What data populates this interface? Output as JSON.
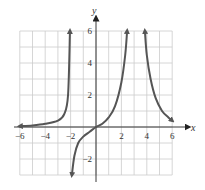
{
  "chart_data": {
    "type": "line",
    "title": "",
    "xlabel": "x",
    "ylabel": "y",
    "xlim": [
      -6,
      6
    ],
    "ylim": [
      -3,
      6
    ],
    "grid": true,
    "grid_step": 1,
    "x_ticks": [
      -6,
      -4,
      -2,
      2,
      4,
      6
    ],
    "y_ticks": [
      -2,
      2,
      4,
      6
    ],
    "x_tick_labels": [
      "−6",
      "−4",
      "−2",
      "2",
      "4",
      "6"
    ],
    "y_tick_labels": [
      "−2",
      "2",
      "4",
      "6"
    ],
    "vertical_asymptotes": [
      -2,
      2.5,
      3.8
    ],
    "series": [
      {
        "name": "left branch",
        "x": [
          -6,
          -5,
          -4,
          -3,
          -2.5,
          -2.2,
          -2.05
        ],
        "y": [
          0.05,
          0.1,
          0.2,
          0.4,
          0.8,
          2.0,
          6.0
        ],
        "arrows": [
          "left",
          "up"
        ]
      },
      {
        "name": "middle branch",
        "x": [
          -1.9,
          -1.7,
          -1.4,
          -1,
          -0.5,
          0,
          0.5,
          1,
          1.5,
          2,
          2.3,
          2.45
        ],
        "y": [
          -3.0,
          -1.8,
          -1.0,
          -0.6,
          -0.3,
          0,
          0.2,
          0.6,
          1.3,
          2.8,
          4.5,
          6.0
        ],
        "arrows": [
          "down",
          "up"
        ]
      },
      {
        "name": "right branch",
        "x": [
          3.85,
          4,
          4.3,
          4.7,
          5.2,
          5.7,
          6
        ],
        "y": [
          6.0,
          4.5,
          3.0,
          1.8,
          1.0,
          0.6,
          0.4
        ],
        "arrows": [
          "up",
          "right-down"
        ]
      }
    ],
    "colors": {
      "curve": "#555555",
      "axis": "#222222",
      "grid": "#cccccc"
    }
  }
}
